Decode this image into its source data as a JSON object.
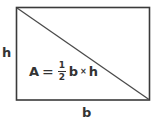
{
  "figure": {
    "shape": {
      "type": "rectangle-with-diagonal",
      "stroke_color": "#3a3a3a",
      "fill_color": "#ffffff",
      "left": 16,
      "top": 7,
      "right": 150,
      "bottom": 100,
      "diagonal_from": "top-left",
      "diagonal_to": "bottom-right"
    },
    "labels": {
      "height": "h",
      "base": "b"
    },
    "formula": {
      "variable": "A",
      "equals": "=",
      "fraction_numerator": "1",
      "fraction_denominator": "2",
      "base": "b",
      "multiply": "×",
      "height": "h",
      "plain_text": "A = 1/2 b × h"
    }
  }
}
